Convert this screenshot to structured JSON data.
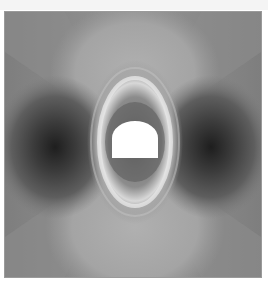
{
  "figure": {
    "type": "grayscale contour map",
    "colors": {
      "background": "#8a8a8a",
      "dark_lobe": "#2a2a2a",
      "bright_ring": "#f2f2f2",
      "opening": "#ffffff",
      "border": "#9a9a9a"
    },
    "opening": {
      "shape": "horseshoe",
      "left_x": 111,
      "right_x": 157,
      "arch_top_y": 120,
      "springline_y": 137,
      "floor_y": 157
    }
  }
}
